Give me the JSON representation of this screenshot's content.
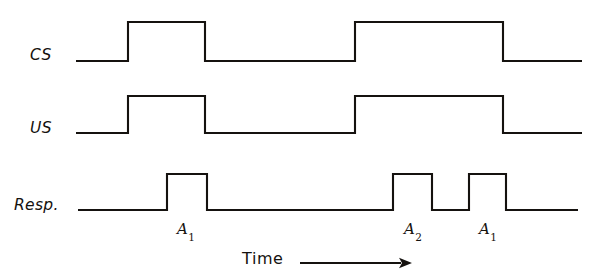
{
  "figure": {
    "type": "timing-diagram",
    "background_color": "#ffffff",
    "line_color": "#15120f",
    "width": 602,
    "height": 277
  },
  "rows": [
    {
      "key": "cs",
      "label": "CS"
    },
    {
      "key": "us",
      "label": "US"
    },
    {
      "key": "resp",
      "label": "Resp."
    }
  ],
  "annotations": {
    "a1_first": "A",
    "a1_first_sub": "1",
    "a2": "A",
    "a2_sub": "2",
    "a1_second": "A",
    "a1_second_sub": "1"
  },
  "axis": {
    "time_label": "Time",
    "arrow": "right-arrow"
  },
  "chart_data": {
    "type": "line",
    "title": "",
    "xlabel": "Time",
    "ylabel": "",
    "grid": false,
    "legend": "none",
    "x": [
      0,
      602
    ],
    "series": [
      {
        "name": "CS",
        "baseline_y": 61,
        "high_y": 22,
        "pulses": [
          {
            "start": 128,
            "end": 205
          },
          {
            "start": 355,
            "end": 503
          }
        ],
        "trace_start": 76,
        "trace_end": 582
      },
      {
        "name": "US",
        "baseline_y": 133,
        "high_y": 96,
        "pulses": [
          {
            "start": 128,
            "end": 205
          },
          {
            "start": 355,
            "end": 503
          }
        ],
        "trace_start": 76,
        "trace_end": 582
      },
      {
        "name": "Resp.",
        "baseline_y": 210,
        "high_y": 174,
        "pulses": [
          {
            "start": 167,
            "end": 207,
            "label": "A1"
          },
          {
            "start": 393,
            "end": 432,
            "label": "A2"
          },
          {
            "start": 469,
            "end": 506,
            "label": "A1"
          }
        ],
        "trace_start": 78,
        "trace_end": 578
      }
    ],
    "time_axis": {
      "start_x": 300,
      "end_x": 412,
      "y": 263
    }
  }
}
